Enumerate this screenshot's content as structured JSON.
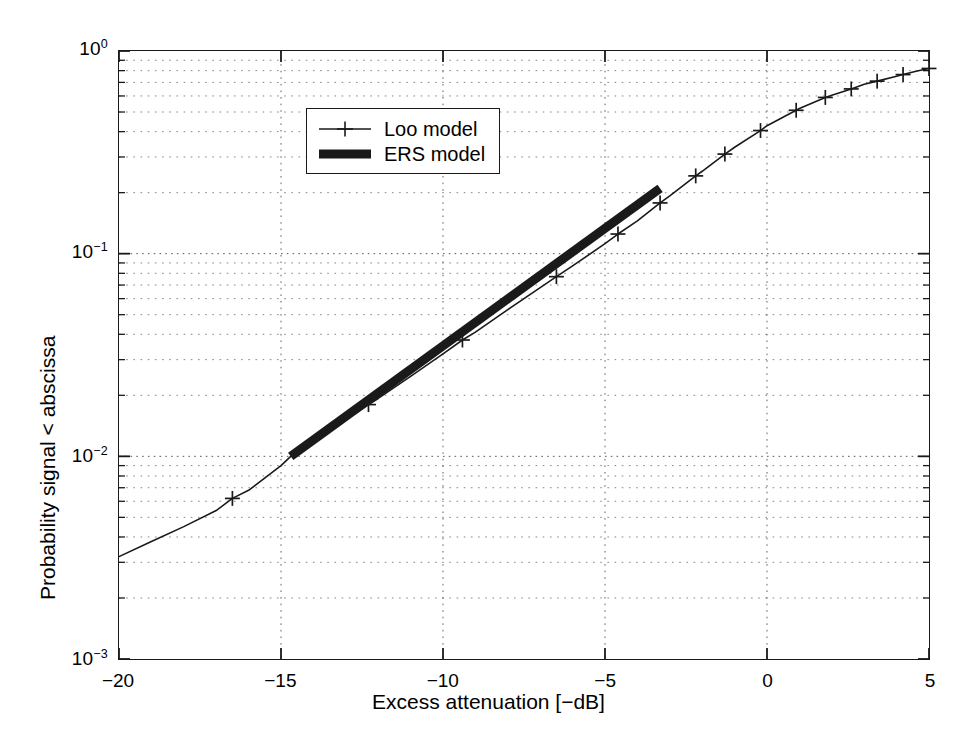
{
  "chart_data": {
    "type": "line",
    "title": "",
    "xlabel": "Excess attenuation [−dB]",
    "ylabel": "Probability signal < abscissa",
    "xlim": [
      -20,
      5
    ],
    "ylim": [
      0.001,
      1
    ],
    "yscale": "log",
    "xscale": "linear",
    "grid": true,
    "grid_style": "dotted",
    "legend_position": "upper-center-left",
    "xticks": [
      -20,
      -15,
      -10,
      -5,
      0,
      5
    ],
    "xtick_labels": [
      "−20",
      "−15",
      "−10",
      "−5",
      "0",
      "5"
    ],
    "yticks": [
      0.001,
      0.01,
      0.1,
      1
    ],
    "ytick_labels": [
      "10⁻³",
      "10⁻²",
      "10⁻¹",
      "10⁰"
    ],
    "ytick_mantissas": [
      "10",
      "10",
      "10",
      "10"
    ],
    "ytick_exponents": [
      "-3",
      "-2",
      "-1",
      "0"
    ],
    "series": [
      {
        "name": "Loo model",
        "style": "thin-line-with-plus-markers",
        "color": "#1a1a1a",
        "linewidth": 1.6,
        "marker": "+",
        "x": [
          -20.0,
          -19.0,
          -18.0,
          -17.0,
          -16.5,
          -16.0,
          -15.0,
          -14.7,
          -14.0,
          -13.0,
          -12.3,
          -12.0,
          -11.0,
          -10.0,
          -9.4,
          -9.0,
          -8.0,
          -7.0,
          -6.5,
          -6.0,
          -5.0,
          -4.6,
          -4.0,
          -3.3,
          -3.0,
          -2.2,
          -2.0,
          -1.3,
          -1.0,
          -0.2,
          0.0,
          0.9,
          1.0,
          1.8,
          2.0,
          2.6,
          3.0,
          3.4,
          4.0,
          4.2,
          4.6,
          5.0
        ],
        "y": [
          0.0032,
          0.0038,
          0.0045,
          0.0054,
          0.0062,
          0.0068,
          0.009,
          0.01,
          0.0119,
          0.0152,
          0.018,
          0.0193,
          0.0248,
          0.032,
          0.0375,
          0.041,
          0.053,
          0.068,
          0.077,
          0.087,
          0.112,
          0.125,
          0.145,
          0.178,
          0.193,
          0.242,
          0.255,
          0.31,
          0.335,
          0.405,
          0.428,
          0.51,
          0.52,
          0.59,
          0.605,
          0.65,
          0.685,
          0.71,
          0.75,
          0.765,
          0.795,
          0.82
        ],
        "marker_x": [
          -16.5,
          -12.3,
          -9.4,
          -6.5,
          -4.6,
          -3.3,
          -2.2,
          -1.3,
          -0.2,
          0.9,
          1.8,
          2.6,
          3.4,
          4.2,
          5.0
        ],
        "marker_y": [
          0.0062,
          0.018,
          0.0375,
          0.077,
          0.125,
          0.178,
          0.242,
          0.31,
          0.405,
          0.51,
          0.59,
          0.65,
          0.71,
          0.765,
          0.82
        ]
      },
      {
        "name": "ERS model",
        "style": "thick-line",
        "color": "#1a1a1a",
        "linewidth": 9,
        "marker": "none",
        "x": [
          -14.7,
          -3.3
        ],
        "y": [
          0.01,
          0.21
        ]
      }
    ]
  },
  "axes": {
    "x_title": "Excess attenuation [−dB]",
    "y_title": "Probability signal < abscissa"
  },
  "legend": {
    "entries": [
      {
        "label": "Loo model",
        "sample": "line-plus-marker"
      },
      {
        "label": "ERS model",
        "sample": "thick-line"
      }
    ]
  }
}
